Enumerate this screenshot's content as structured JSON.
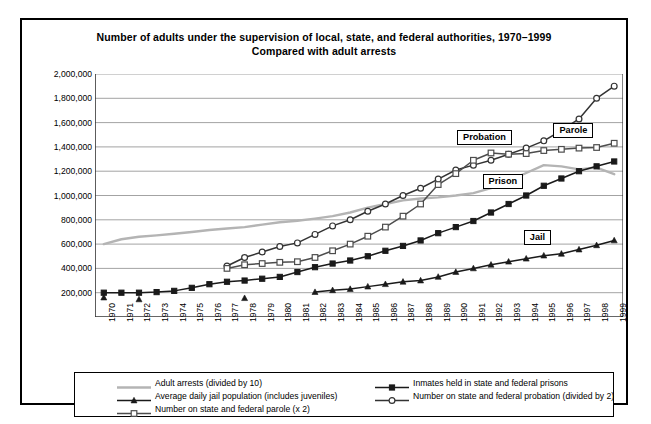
{
  "chart_data": {
    "type": "line",
    "title": "Number of adults under the supervision of local, state, and federal authorities, 1970–1999",
    "subtitle": "Compared with adult arrests",
    "xlabel": "",
    "ylabel": "",
    "grid": true,
    "legend_position": "bottom",
    "ylim": [
      0,
      2000000
    ],
    "yticks": [
      200000,
      400000,
      600000,
      800000,
      1000000,
      1200000,
      1400000,
      1600000,
      1800000,
      2000000
    ],
    "ytick_labels": [
      "200,000",
      "400,000",
      "600,000",
      "800,000",
      "1,000,000",
      "1,200,000",
      "1,400,000",
      "1,600,000",
      "1,800,000",
      "2,000,000"
    ],
    "x": [
      1970,
      1971,
      1972,
      1973,
      1974,
      1975,
      1976,
      1977,
      1978,
      1979,
      1980,
      1981,
      1982,
      1983,
      1984,
      1985,
      1986,
      1987,
      1988,
      1989,
      1990,
      1991,
      1992,
      1993,
      1994,
      1995,
      1996,
      1997,
      1998,
      1999
    ],
    "xtick_labels": [
      "1970",
      "1971",
      "1972",
      "1973",
      "1974",
      "1975",
      "1976",
      "1977",
      "1978",
      "1979",
      "1980",
      "1981",
      "1982",
      "1983",
      "1984",
      "1985",
      "1986",
      "1987",
      "1988",
      "1989",
      "1990",
      "1991",
      "1992",
      "1993",
      "1994",
      "1995",
      "1996",
      "1997",
      "1998",
      "1999"
    ],
    "series": [
      {
        "name": "Adult arrests (divided by 10)",
        "key": "arrests",
        "color": "#b4b4b4",
        "marker": "none",
        "values": [
          600000,
          640000,
          660000,
          672000,
          685000,
          700000,
          716000,
          728000,
          740000,
          760000,
          780000,
          792000,
          810000,
          830000,
          860000,
          900000,
          930000,
          960000,
          975000,
          985000,
          1000000,
          1020000,
          1060000,
          1120000,
          1185000,
          1250000,
          1240000,
          1215000,
          1230000,
          1175000
        ]
      },
      {
        "name": "Inmates held in state and federal prisons",
        "key": "prison",
        "color": "#1a1a1a",
        "marker": "square-filled",
        "values": [
          200000,
          200000,
          200000,
          205000,
          215000,
          240000,
          270000,
          290000,
          300000,
          315000,
          330000,
          370000,
          410000,
          440000,
          465000,
          500000,
          545000,
          585000,
          630000,
          690000,
          740000,
          790000,
          860000,
          930000,
          1000000,
          1080000,
          1140000,
          1200000,
          1240000,
          1280000
        ]
      },
      {
        "name": "Average daily jail population (includes juveniles)",
        "key": "jail",
        "color": "#1a1a1a",
        "marker": "triangle-filled",
        "values": [
          160000,
          null,
          145000,
          null,
          null,
          null,
          null,
          null,
          155000,
          null,
          null,
          null,
          205000,
          220000,
          230000,
          250000,
          270000,
          290000,
          300000,
          330000,
          370000,
          400000,
          430000,
          455000,
          480000,
          505000,
          520000,
          555000,
          590000,
          630000
        ]
      },
      {
        "name": "Number on state and federal probation (divided by 2)",
        "key": "probation",
        "color": "#333333",
        "marker": "circle-open",
        "values": [
          null,
          null,
          null,
          null,
          null,
          null,
          null,
          420000,
          490000,
          535000,
          580000,
          610000,
          680000,
          750000,
          800000,
          870000,
          930000,
          1000000,
          1060000,
          1135000,
          1210000,
          1250000,
          1290000,
          1340000,
          1390000,
          1450000,
          1535000,
          1630000,
          1800000,
          1900000
        ]
      },
      {
        "name": "Number on state and federal parole (x 2)",
        "key": "parole",
        "color": "#4d4d4d",
        "marker": "square-open",
        "values": [
          null,
          null,
          null,
          null,
          null,
          null,
          null,
          400000,
          430000,
          440000,
          450000,
          455000,
          490000,
          545000,
          600000,
          665000,
          740000,
          830000,
          930000,
          1090000,
          1180000,
          1290000,
          1350000,
          1340000,
          1345000,
          1370000,
          1380000,
          1390000,
          1395000,
          1430000
        ]
      }
    ],
    "annotations": [
      {
        "label": "Probation",
        "series": "probation",
        "x": 1992
      },
      {
        "label": "Parole",
        "series": "parole",
        "x": 1996
      },
      {
        "label": "Prison",
        "series": "prison",
        "x": 1993
      },
      {
        "label": "Jail",
        "series": "jail",
        "x": 1995
      }
    ]
  }
}
